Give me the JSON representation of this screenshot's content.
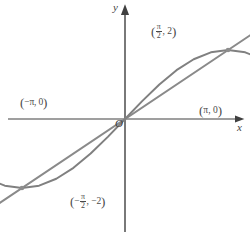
{
  "figure": {
    "background_color": "#ffffff",
    "curve_color": "#808080",
    "line_color": "#8a8a8a",
    "axis_color": "#404040",
    "label_color": "#4a4a4a"
  },
  "axes": {
    "x_label": "x",
    "y_label": "y",
    "origin_label": "O"
  },
  "points": {
    "left_zero": {
      "label_open": "(",
      "label_text": "−π, 0",
      "label_close": ")",
      "x": -3.14159,
      "y": 0
    },
    "right_zero": {
      "label_open": "(",
      "label_text": "π, 0",
      "label_close": ")",
      "x": 3.14159,
      "y": 0
    },
    "max_point": {
      "label_open": "(",
      "numerator": "π",
      "denominator": "2",
      "separator": ", ",
      "y_value": "2",
      "label_close": ")",
      "x": 1.5708,
      "y": 2
    },
    "min_point": {
      "label_open": "(",
      "sign": "−",
      "numerator": "π",
      "denominator": "2",
      "separator": ", ",
      "y_value": "−2",
      "label_close": ")",
      "x": -1.5708,
      "y": -2
    }
  },
  "chart_data": {
    "type": "line",
    "title": "",
    "xlabel": "x",
    "ylabel": "y",
    "xlim": [
      -3.6,
      3.6
    ],
    "ylim": [
      -4.2,
      4.0
    ],
    "grid": false,
    "legend": "none",
    "annotations": [
      {
        "text": "(−π, 0)",
        "x": -3.14159,
        "y": 0
      },
      {
        "text": "(π, 0)",
        "x": 3.14159,
        "y": 0
      },
      {
        "text": "(π/2, 2)",
        "x": 1.5708,
        "y": 2
      },
      {
        "text": "(−π/2, −2)",
        "x": -1.5708,
        "y": -2
      },
      {
        "text": "O",
        "x": 0,
        "y": 0
      }
    ],
    "marked_points": [
      {
        "x": -3.14159,
        "y": 0
      },
      {
        "x": 3.14159,
        "y": 0
      },
      {
        "x": 1.5708,
        "y": 2
      },
      {
        "x": -1.5708,
        "y": -2
      }
    ],
    "series": [
      {
        "name": "y = 2 sin x",
        "kind": "curve",
        "color": "#808080",
        "x": [
          -3.14159,
          -2.87979,
          -2.61799,
          -2.35619,
          -2.0944,
          -1.8326,
          -1.5708,
          -1.309,
          -1.0472,
          -0.7854,
          -0.5236,
          -0.2618,
          0,
          0.2618,
          0.5236,
          0.7854,
          1.0472,
          1.309,
          1.5708,
          1.8326,
          2.0944,
          2.35619,
          2.61799,
          2.87979,
          3.14159
        ],
        "y": [
          0,
          -0.5176,
          -1.0,
          -1.4142,
          -1.7321,
          -1.9319,
          -2.0,
          -1.9319,
          -1.7321,
          -1.4142,
          -1.0,
          -0.5176,
          0,
          0.5176,
          1.0,
          1.4142,
          1.7321,
          1.9319,
          2.0,
          1.9319,
          1.7321,
          1.4142,
          1.0,
          0.5176,
          0
        ]
      },
      {
        "name": "y = (4/π) x",
        "kind": "straight-line",
        "color": "#8a8a8a",
        "x": [
          -2.6,
          2.9
        ],
        "y": [
          -3.31,
          3.69
        ]
      }
    ]
  }
}
